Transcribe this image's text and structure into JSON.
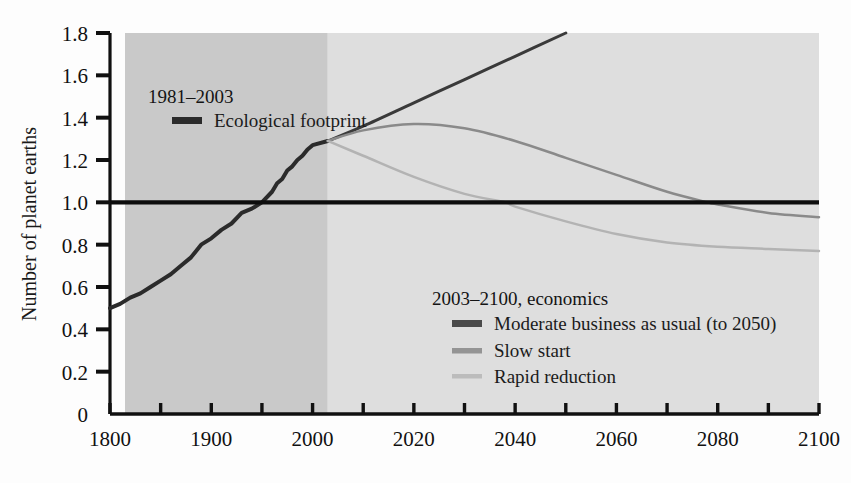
{
  "chart_data": {
    "type": "line",
    "title": "",
    "xlabel": "",
    "ylabel": "Number of planet earths",
    "ylim": [
      0,
      1.8
    ],
    "xlim": [
      1800,
      2100
    ],
    "grid": false,
    "legend_position": "inside",
    "y_ticks": [
      "0",
      "0.2",
      "0.4",
      "0.6",
      "0.8",
      "1.0",
      "1.2",
      "1.4",
      "1.6",
      "1.8"
    ],
    "y_tick_values": [
      0,
      0.2,
      0.4,
      0.6,
      0.8,
      1.0,
      1.2,
      1.4,
      1.6,
      1.8
    ],
    "x_tick_values": [
      1800,
      1850,
      1900,
      1950,
      2000,
      2010,
      2020,
      2030,
      2040,
      2050,
      2060,
      2070,
      2080,
      2090,
      2100
    ],
    "x_tick_labels": [
      "1800",
      "",
      "1900",
      "",
      "2000",
      "",
      "2020",
      "",
      "2040",
      "",
      "2060",
      "",
      "2080",
      "",
      "2100"
    ],
    "x_axis_note": "piecewise scale: 50-year steps before 2000, 10-year steps after 2000",
    "reference_line": {
      "label": "1.0 earth capacity",
      "value": 1.0
    },
    "shaded_bands": [
      {
        "name": "historical-band",
        "from": 1800,
        "to": 2003,
        "color": "#c9c9c9"
      },
      {
        "name": "projection-band",
        "from": 2003,
        "to": 2100,
        "color": "#dedede"
      }
    ],
    "series": [
      {
        "name": "Ecological footprint",
        "period": "1981-2003",
        "color": "#2b2b2b",
        "width": 4.0,
        "x": [
          1800,
          1810,
          1820,
          1830,
          1840,
          1850,
          1860,
          1870,
          1880,
          1890,
          1900,
          1910,
          1920,
          1930,
          1940,
          1950,
          1960,
          1965,
          1970,
          1975,
          1980,
          1985,
          1990,
          1995,
          2000,
          2003
        ],
        "y": [
          0.5,
          0.52,
          0.55,
          0.57,
          0.6,
          0.63,
          0.66,
          0.7,
          0.74,
          0.8,
          0.83,
          0.87,
          0.9,
          0.95,
          0.97,
          1.0,
          1.05,
          1.09,
          1.11,
          1.15,
          1.17,
          1.2,
          1.22,
          1.25,
          1.27,
          1.29
        ]
      },
      {
        "name": "Moderate business as usual (to 2050)",
        "period": "2003-2100, economics",
        "color": "#3a3a3a",
        "width": 3.0,
        "x": [
          2003,
          2010,
          2020,
          2030,
          2040,
          2050
        ],
        "y": [
          1.29,
          1.36,
          1.47,
          1.58,
          1.69,
          1.8
        ]
      },
      {
        "name": "Slow start",
        "period": "2003-2100, economics",
        "color": "#8a8a8a",
        "width": 2.5,
        "x": [
          2003,
          2010,
          2020,
          2030,
          2040,
          2050,
          2060,
          2070,
          2078,
          2080,
          2090,
          2100
        ],
        "y": [
          1.29,
          1.34,
          1.37,
          1.35,
          1.29,
          1.21,
          1.13,
          1.05,
          1.0,
          0.99,
          0.95,
          0.93
        ]
      },
      {
        "name": "Rapid reduction",
        "period": "2003-2100, economics",
        "color": "#b3b3b3",
        "width": 2.5,
        "x": [
          2003,
          2010,
          2020,
          2030,
          2038,
          2040,
          2050,
          2060,
          2070,
          2080,
          2090,
          2100
        ],
        "y": [
          1.29,
          1.22,
          1.12,
          1.04,
          1.0,
          0.98,
          0.91,
          0.85,
          0.81,
          0.79,
          0.78,
          0.77
        ]
      }
    ]
  },
  "axis": {
    "y_title": "Number of planet earths"
  },
  "legend_historical": {
    "heading": "1981–2003",
    "items": [
      {
        "label": "Ecological footprint",
        "color": "#2b2b2b",
        "thickness": 6
      }
    ]
  },
  "legend_projection": {
    "heading": "2003–2100, economics",
    "items": [
      {
        "label": "Moderate business as usual (to 2050)",
        "color": "#4a4a4a",
        "thickness": 6
      },
      {
        "label": "Slow start",
        "color": "#949494",
        "thickness": 5
      },
      {
        "label": "Rapid reduction",
        "color": "#bcbcbc",
        "thickness": 4
      }
    ]
  }
}
